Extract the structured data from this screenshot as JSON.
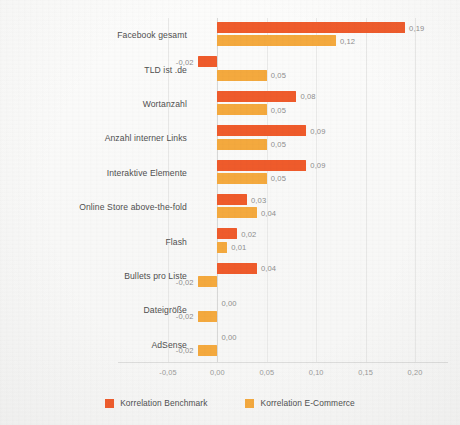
{
  "chart_data": {
    "type": "bar",
    "orientation": "horizontal",
    "title": "",
    "subtitle": "",
    "xlabel": "",
    "ylabel": "",
    "xlim": [
      -0.05,
      0.2
    ],
    "xticks": [
      "-0,05",
      "0,00",
      "0,05",
      "0,10",
      "0,15",
      "0,20"
    ],
    "xtick_values": [
      -0.05,
      0.0,
      0.05,
      0.1,
      0.15,
      0.2
    ],
    "grid": true,
    "legend_position": "bottom",
    "decimal_separator": ",",
    "categories": [
      "Facebook gesamt",
      "TLD ist .de",
      "Wortanzahl",
      "Anzahl interner Links",
      "Interaktive Elemente",
      "Online Store above-the-fold",
      "Flash",
      "Bullets pro Liste",
      "Dateigröße",
      "AdSense"
    ],
    "series": [
      {
        "name": "Korrelation Benchmark",
        "color": "#ef5b2b",
        "values": [
          0.19,
          -0.02,
          0.08,
          0.09,
          0.09,
          0.03,
          0.02,
          0.04,
          0.0,
          0.0
        ],
        "labels": [
          "0,19",
          "-0,02",
          "0,08",
          "0,09",
          "0,09",
          "0,03",
          "0,02",
          "0,04",
          "0,00",
          "0,00"
        ]
      },
      {
        "name": "Korrelation E-Commerce",
        "color": "#f4a93e",
        "values": [
          0.12,
          0.05,
          0.05,
          0.05,
          0.05,
          0.04,
          0.01,
          -0.02,
          -0.02,
          -0.02
        ],
        "labels": [
          "0,12",
          "0,05",
          "0,05",
          "0,05",
          "0,05",
          "0,04",
          "0,01",
          "-0,02",
          "-0,02",
          "-0,02"
        ]
      }
    ]
  },
  "legend": {
    "items": [
      {
        "label": "Korrelation Benchmark",
        "color": "#ef5b2b"
      },
      {
        "label": "Korrelation E-Commerce",
        "color": "#f4a93e"
      }
    ]
  },
  "colors": {
    "benchmark": "#ef5b2b",
    "ecommerce": "#f4a93e",
    "background": "#fbfbfa",
    "grid": "#e9e9e8",
    "axis_text": "#9a9a99",
    "label_text": "#4f4f4f",
    "value_text": "#8e8e8d"
  }
}
